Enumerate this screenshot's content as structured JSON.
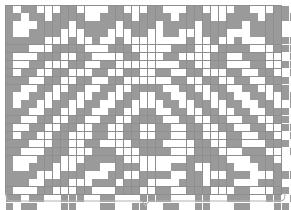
{
  "chart_data": {
    "type": "heatmap",
    "title": "",
    "subtitle": "",
    "xlabel": "",
    "ylabel": "",
    "legend": [],
    "annotations": [
      {
        "name": "pattern-repeat-brace",
        "kind": "horizontal-curly-brace",
        "spans": "full chart width",
        "label": ""
      }
    ],
    "layout": {
      "grid": true,
      "legend_position": "none",
      "cell_size_px": 7.3,
      "origin_px": [
        5,
        5
      ]
    },
    "colors": {
      "filled": "#9a9a9a",
      "empty": "#ffffff",
      "gridline": "#8e8e8e",
      "brace": "#b0b0b0",
      "background": "#ffffff"
    },
    "legend_symbols": [
      {
        "swatch": "#9a9a9a",
        "meaning": "filled-stitch"
      },
      {
        "swatch": "#ffffff",
        "meaning": "empty-stitch"
      }
    ],
    "columns": 38,
    "rows": 26,
    "x": [
      1,
      2,
      3,
      4,
      5,
      6,
      7,
      8,
      9,
      10,
      11,
      12,
      13,
      14,
      15,
      16,
      17,
      18,
      19,
      20,
      21,
      22,
      23,
      24,
      25,
      26,
      27,
      28,
      29,
      30,
      31,
      32,
      33,
      34,
      35,
      36,
      37,
      38
    ],
    "categories": [
      "row-1",
      "row-2",
      "row-3",
      "row-4",
      "row-5",
      "row-6",
      "row-7",
      "row-8",
      "row-9",
      "row-10",
      "row-11",
      "row-12",
      "row-13",
      "row-14",
      "row-15",
      "row-16",
      "row-17",
      "row-18",
      "row-19",
      "row-20",
      "row-21",
      "row-22",
      "row-23",
      "row-24",
      "row-25",
      "row-26"
    ],
    "values": [
      [
        1,
        0,
        1,
        1,
        0,
        0,
        0,
        1,
        1,
        0,
        0,
        0,
        0,
        1,
        1,
        0,
        0,
        0,
        1,
        1,
        0,
        0,
        0,
        1,
        1,
        0,
        0,
        0,
        0,
        1,
        1,
        0,
        0,
        0,
        1,
        1,
        0,
        1
      ],
      [
        1,
        1,
        0,
        1,
        1,
        0,
        1,
        1,
        1,
        1,
        0,
        0,
        1,
        1,
        1,
        1,
        0,
        1,
        1,
        1,
        1,
        0,
        1,
        1,
        1,
        1,
        0,
        0,
        1,
        1,
        1,
        1,
        0,
        1,
        1,
        1,
        1,
        1
      ],
      [
        1,
        0,
        0,
        0,
        1,
        1,
        1,
        1,
        0,
        1,
        1,
        1,
        1,
        1,
        0,
        1,
        1,
        1,
        1,
        0,
        1,
        1,
        1,
        1,
        0,
        1,
        1,
        1,
        1,
        1,
        0,
        1,
        1,
        1,
        1,
        0,
        0,
        1
      ],
      [
        1,
        0,
        0,
        1,
        1,
        1,
        1,
        0,
        0,
        0,
        1,
        1,
        1,
        0,
        0,
        0,
        1,
        1,
        0,
        0,
        1,
        1,
        0,
        0,
        0,
        1,
        1,
        1,
        0,
        0,
        0,
        1,
        1,
        1,
        1,
        0,
        0,
        1
      ],
      [
        1,
        1,
        1,
        1,
        1,
        0,
        0,
        0,
        1,
        0,
        0,
        1,
        0,
        0,
        1,
        0,
        0,
        0,
        0,
        0,
        0,
        0,
        0,
        1,
        0,
        0,
        1,
        0,
        0,
        1,
        0,
        0,
        0,
        1,
        1,
        1,
        1,
        1
      ],
      [
        1,
        1,
        1,
        0,
        0,
        0,
        1,
        1,
        1,
        1,
        0,
        0,
        0,
        1,
        1,
        1,
        0,
        0,
        0,
        0,
        0,
        1,
        1,
        1,
        0,
        0,
        0,
        1,
        1,
        1,
        1,
        0,
        0,
        0,
        1,
        1,
        1,
        1
      ],
      [
        1,
        0,
        0,
        0,
        1,
        1,
        1,
        0,
        0,
        1,
        1,
        0,
        0,
        0,
        0,
        1,
        1,
        0,
        0,
        0,
        1,
        1,
        0,
        0,
        0,
        0,
        1,
        1,
        0,
        0,
        1,
        1,
        1,
        0,
        0,
        0,
        1,
        1
      ],
      [
        1,
        0,
        0,
        1,
        1,
        0,
        0,
        0,
        1,
        1,
        0,
        0,
        1,
        1,
        0,
        0,
        0,
        0,
        0,
        0,
        0,
        0,
        1,
        1,
        0,
        0,
        1,
        1,
        0,
        0,
        0,
        1,
        1,
        0,
        0,
        1,
        1,
        1
      ],
      [
        1,
        0,
        1,
        1,
        0,
        0,
        1,
        1,
        0,
        0,
        0,
        1,
        1,
        0,
        0,
        1,
        1,
        0,
        0,
        1,
        1,
        0,
        0,
        1,
        1,
        0,
        0,
        0,
        1,
        1,
        0,
        0,
        1,
        1,
        0,
        0,
        1,
        1
      ],
      [
        1,
        1,
        1,
        0,
        0,
        1,
        1,
        0,
        0,
        1,
        1,
        0,
        0,
        1,
        1,
        0,
        0,
        0,
        0,
        0,
        0,
        1,
        1,
        0,
        0,
        1,
        1,
        0,
        0,
        1,
        1,
        0,
        0,
        1,
        1,
        1,
        0,
        1
      ],
      [
        1,
        1,
        0,
        0,
        1,
        1,
        0,
        0,
        1,
        1,
        0,
        0,
        1,
        1,
        0,
        0,
        1,
        1,
        1,
        1,
        0,
        0,
        1,
        1,
        0,
        0,
        1,
        1,
        0,
        0,
        1,
        1,
        0,
        0,
        1,
        1,
        0,
        1
      ],
      [
        1,
        0,
        0,
        1,
        1,
        0,
        0,
        1,
        1,
        0,
        0,
        1,
        1,
        0,
        0,
        1,
        1,
        0,
        0,
        1,
        1,
        0,
        0,
        1,
        1,
        0,
        0,
        1,
        1,
        0,
        0,
        1,
        1,
        0,
        0,
        1,
        1,
        1
      ],
      [
        1,
        0,
        1,
        1,
        0,
        0,
        1,
        1,
        0,
        0,
        1,
        1,
        0,
        0,
        1,
        1,
        0,
        0,
        0,
        0,
        1,
        1,
        0,
        0,
        1,
        1,
        0,
        0,
        1,
        1,
        0,
        0,
        1,
        1,
        0,
        0,
        1,
        1
      ],
      [
        1,
        1,
        1,
        0,
        0,
        1,
        1,
        0,
        0,
        1,
        1,
        0,
        0,
        1,
        1,
        0,
        0,
        1,
        1,
        0,
        0,
        1,
        1,
        0,
        0,
        1,
        1,
        0,
        0,
        1,
        1,
        0,
        0,
        1,
        1,
        1,
        0,
        1
      ],
      [
        1,
        1,
        0,
        0,
        1,
        1,
        0,
        0,
        1,
        1,
        0,
        0,
        1,
        1,
        0,
        0,
        1,
        1,
        1,
        1,
        0,
        0,
        1,
        1,
        0,
        0,
        1,
        1,
        0,
        0,
        1,
        1,
        0,
        0,
        1,
        1,
        0,
        1
      ],
      [
        1,
        0,
        0,
        1,
        1,
        0,
        0,
        1,
        1,
        0,
        0,
        1,
        1,
        0,
        0,
        1,
        1,
        0,
        0,
        1,
        1,
        0,
        0,
        1,
        1,
        0,
        0,
        1,
        1,
        0,
        0,
        1,
        1,
        0,
        0,
        1,
        1,
        1
      ],
      [
        1,
        0,
        1,
        1,
        0,
        0,
        1,
        1,
        0,
        0,
        0,
        1,
        1,
        0,
        0,
        1,
        1,
        0,
        0,
        1,
        1,
        0,
        0,
        1,
        1,
        0,
        0,
        0,
        1,
        1,
        0,
        0,
        1,
        1,
        0,
        0,
        1,
        1
      ],
      [
        1,
        1,
        1,
        0,
        0,
        0,
        1,
        1,
        0,
        0,
        1,
        1,
        0,
        0,
        0,
        0,
        1,
        1,
        1,
        1,
        0,
        0,
        0,
        0,
        1,
        1,
        0,
        0,
        1,
        1,
        0,
        0,
        0,
        1,
        1,
        1,
        0,
        1
      ],
      [
        1,
        1,
        0,
        0,
        0,
        1,
        1,
        1,
        0,
        0,
        0,
        1,
        1,
        1,
        0,
        0,
        0,
        1,
        1,
        1,
        1,
        0,
        0,
        0,
        1,
        1,
        1,
        0,
        0,
        0,
        1,
        1,
        1,
        0,
        0,
        0,
        1,
        1
      ],
      [
        1,
        0,
        0,
        0,
        1,
        1,
        1,
        0,
        0,
        0,
        1,
        1,
        1,
        1,
        1,
        0,
        0,
        0,
        0,
        0,
        0,
        0,
        0,
        1,
        1,
        1,
        1,
        1,
        0,
        0,
        0,
        1,
        1,
        1,
        0,
        0,
        0,
        1
      ],
      [
        1,
        0,
        0,
        1,
        1,
        1,
        0,
        0,
        0,
        1,
        1,
        1,
        0,
        0,
        1,
        1,
        1,
        0,
        0,
        0,
        0,
        1,
        1,
        1,
        0,
        0,
        1,
        1,
        1,
        0,
        0,
        0,
        1,
        1,
        1,
        0,
        0,
        1
      ],
      [
        1,
        1,
        1,
        1,
        0,
        0,
        0,
        1,
        1,
        1,
        0,
        0,
        0,
        1,
        1,
        0,
        0,
        1,
        1,
        1,
        1,
        0,
        0,
        1,
        1,
        0,
        0,
        0,
        1,
        1,
        1,
        0,
        0,
        0,
        1,
        1,
        1,
        1
      ],
      [
        1,
        1,
        1,
        0,
        0,
        1,
        1,
        1,
        0,
        0,
        0,
        1,
        1,
        1,
        0,
        1,
        1,
        1,
        0,
        0,
        0,
        0,
        1,
        1,
        1,
        0,
        1,
        1,
        1,
        0,
        0,
        0,
        1,
        1,
        1,
        0,
        0,
        1
      ],
      [
        1,
        0,
        0,
        0,
        1,
        1,
        0,
        0,
        0,
        1,
        1,
        0,
        0,
        0,
        1,
        1,
        1,
        0,
        0,
        1,
        1,
        0,
        0,
        1,
        1,
        1,
        0,
        0,
        0,
        1,
        1,
        0,
        0,
        0,
        1,
        1,
        0,
        1
      ],
      [
        1,
        1,
        0,
        1,
        1,
        0,
        0,
        1,
        1,
        1,
        0,
        0,
        1,
        1,
        0,
        0,
        0,
        1,
        1,
        1,
        1,
        0,
        0,
        0,
        1,
        1,
        0,
        0,
        1,
        1,
        1,
        0,
        0,
        1,
        1,
        0,
        1,
        1
      ],
      [
        1,
        0,
        1,
        1,
        0,
        0,
        0,
        1,
        1,
        0,
        0,
        0,
        1,
        1,
        0,
        0,
        1,
        1,
        0,
        0,
        1,
        1,
        0,
        0,
        1,
        1,
        0,
        0,
        0,
        1,
        1,
        0,
        0,
        0,
        1,
        1,
        0,
        1
      ]
    ]
  }
}
